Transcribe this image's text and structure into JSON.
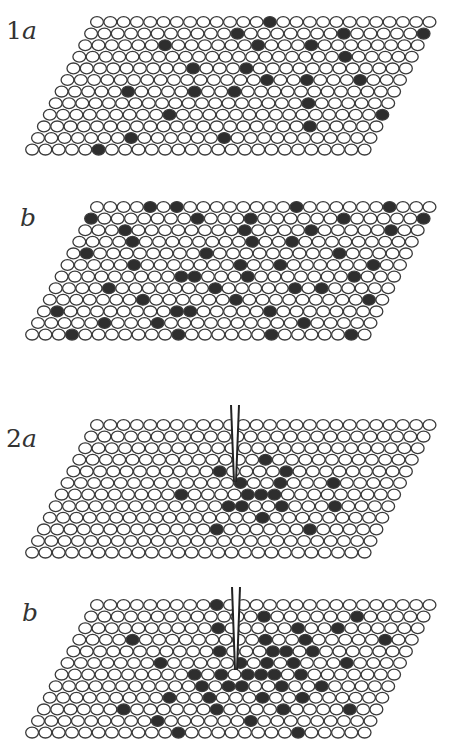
{
  "figure": {
    "panels": [
      {
        "id": "1a",
        "number": "1",
        "letter": "a",
        "top": 10,
        "label_x": 6,
        "label_y": 6,
        "lattice": {
          "rows": 12,
          "cols": 26,
          "origin_x": 97,
          "origin_y": 12,
          "dx": 13.3,
          "dy": 11.6,
          "shear": -5.9,
          "rx": 6.4,
          "ry": 5.4,
          "filled": [
            [
              0,
              13
            ],
            [
              0,
              28
            ],
            [
              1,
              11
            ],
            [
              1,
              19
            ],
            [
              1,
              25
            ],
            [
              2,
              6
            ],
            [
              2,
              17
            ],
            [
              2,
              13
            ],
            [
              3,
              20
            ],
            [
              3,
              26
            ],
            [
              4,
              13
            ],
            [
              4,
              9
            ],
            [
              5,
              15
            ],
            [
              5,
              22
            ],
            [
              5,
              18
            ],
            [
              6,
              5
            ],
            [
              6,
              13
            ],
            [
              6,
              10
            ],
            [
              7,
              19
            ],
            [
              7,
              30
            ],
            [
              8,
              9
            ],
            [
              8,
              25
            ],
            [
              9,
              26
            ],
            [
              9,
              20
            ],
            [
              10,
              14
            ],
            [
              10,
              7
            ],
            [
              11,
              5
            ],
            [
              11,
              30
            ]
          ]
        },
        "probe": null
      },
      {
        "id": "1b",
        "number": "",
        "letter": "b",
        "top": 195,
        "label_x": 20,
        "label_y": 8,
        "lattice": {
          "rows": 12,
          "cols": 26,
          "origin_x": 97,
          "origin_y": 12,
          "dx": 13.3,
          "dy": 11.6,
          "shear": -5.9,
          "rx": 6.4,
          "ry": 5.4,
          "filled": [
            [
              0,
              4
            ],
            [
              0,
              6
            ],
            [
              0,
              15
            ],
            [
              0,
              22
            ],
            [
              0,
              26
            ],
            [
              0,
              28
            ],
            [
              1,
              0
            ],
            [
              1,
              8
            ],
            [
              1,
              12
            ],
            [
              1,
              19
            ],
            [
              1,
              25
            ],
            [
              2,
              3
            ],
            [
              2,
              12
            ],
            [
              2,
              17
            ],
            [
              2,
              23
            ],
            [
              3,
              4
            ],
            [
              3,
              13
            ],
            [
              3,
              16
            ],
            [
              3,
              27
            ],
            [
              3,
              31
            ],
            [
              4,
              1
            ],
            [
              4,
              10
            ],
            [
              4,
              20
            ],
            [
              4,
              26
            ],
            [
              4,
              30
            ],
            [
              5,
              5
            ],
            [
              5,
              13
            ],
            [
              5,
              16
            ],
            [
              5,
              23
            ],
            [
              5,
              28
            ],
            [
              6,
              9
            ],
            [
              6,
              10
            ],
            [
              6,
              14
            ],
            [
              6,
              22
            ],
            [
              6,
              31
            ],
            [
              7,
              4
            ],
            [
              7,
              12
            ],
            [
              7,
              18
            ],
            [
              7,
              20
            ],
            [
              7,
              27
            ],
            [
              8,
              7
            ],
            [
              8,
              14
            ],
            [
              8,
              24
            ],
            [
              8,
              30
            ],
            [
              9,
              1
            ],
            [
              9,
              10
            ],
            [
              9,
              11
            ],
            [
              9,
              17
            ],
            [
              9,
              27
            ],
            [
              10,
              5
            ],
            [
              10,
              9
            ],
            [
              10,
              20
            ],
            [
              10,
              26
            ],
            [
              11,
              3
            ],
            [
              11,
              11
            ],
            [
              11,
              18
            ],
            [
              11,
              24
            ],
            [
              11,
              28
            ]
          ]
        },
        "probe": null
      },
      {
        "id": "2a",
        "number": "2",
        "letter": "a",
        "top": 410,
        "label_x": 6,
        "label_y": 14,
        "lattice": {
          "rows": 12,
          "cols": 26,
          "origin_x": 97,
          "origin_y": 15,
          "dx": 13.3,
          "dy": 11.6,
          "shear": -5.9,
          "rx": 6.4,
          "ry": 5.4,
          "filled": [
            [
              3,
              14
            ],
            [
              4,
              11
            ],
            [
              4,
              16
            ],
            [
              5,
              13
            ],
            [
              5,
              16
            ],
            [
              5,
              20
            ],
            [
              6,
              9
            ],
            [
              6,
              14
            ],
            [
              6,
              15
            ],
            [
              6,
              16
            ],
            [
              7,
              13
            ],
            [
              7,
              14
            ],
            [
              7,
              17
            ],
            [
              7,
              21
            ],
            [
              8,
              16
            ],
            [
              9,
              13
            ],
            [
              9,
              20
            ]
          ]
        },
        "probe": {
          "x": 235,
          "top": -5,
          "bottom": 72,
          "gap": 8
        }
      },
      {
        "id": "2b",
        "number": "",
        "letter": "b",
        "top": 590,
        "label_x": 22,
        "label_y": 8,
        "lattice": {
          "rows": 12,
          "cols": 26,
          "origin_x": 97,
          "origin_y": 15,
          "dx": 13.3,
          "dy": 11.6,
          "shear": -5.9,
          "rx": 6.4,
          "ry": 5.4,
          "filled": [
            [
              0,
              9
            ],
            [
              1,
              13
            ],
            [
              1,
              20
            ],
            [
              2,
              10
            ],
            [
              2,
              16
            ],
            [
              2,
              19
            ],
            [
              3,
              4
            ],
            [
              3,
              14
            ],
            [
              3,
              17
            ],
            [
              3,
              23
            ],
            [
              4,
              11
            ],
            [
              4,
              15
            ],
            [
              4,
              16
            ],
            [
              4,
              18
            ],
            [
              4,
              28
            ],
            [
              5,
              7
            ],
            [
              5,
              13
            ],
            [
              5,
              15
            ],
            [
              5,
              17
            ],
            [
              5,
              21
            ],
            [
              6,
              10
            ],
            [
              6,
              12
            ],
            [
              6,
              14
            ],
            [
              6,
              15
            ],
            [
              6,
              16
            ],
            [
              6,
              18
            ],
            [
              7,
              11
            ],
            [
              7,
              13
            ],
            [
              7,
              14
            ],
            [
              7,
              17
            ],
            [
              7,
              20
            ],
            [
              8,
              9
            ],
            [
              8,
              12
            ],
            [
              8,
              16
            ],
            [
              8,
              19
            ],
            [
              9,
              6
            ],
            [
              9,
              13
            ],
            [
              9,
              18
            ],
            [
              9,
              23
            ],
            [
              10,
              9
            ],
            [
              10,
              16
            ],
            [
              11,
              11
            ],
            [
              11,
              20
            ]
          ]
        },
        "probe": {
          "x": 236,
          "top": -3,
          "bottom": 80,
          "gap": 8
        }
      }
    ]
  },
  "colors": {
    "ring": "#3a3a3a",
    "filled": "#2e2e2e",
    "background": "#ffffff",
    "label": "#333333"
  }
}
